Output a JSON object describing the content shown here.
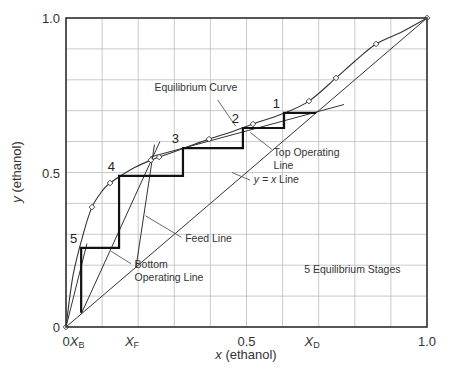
{
  "chart_data": {
    "type": "line",
    "xlabel_var": "x",
    "xlabel_rest": " (ethanol)",
    "ylabel_var": "y",
    "ylabel_rest": " (ethanol)",
    "xlim": [
      0,
      1.0
    ],
    "ylim": [
      0,
      1.0
    ],
    "grid": true,
    "grid_step": 0.1,
    "x_ticks": [
      {
        "value": 0,
        "label": "0"
      },
      {
        "value": 0.5,
        "label": "0.5"
      },
      {
        "value": 1.0,
        "label": "1.0"
      }
    ],
    "y_ticks": [
      {
        "value": 0,
        "label": "0"
      },
      {
        "value": 0.5,
        "label": "0.5"
      },
      {
        "value": 1.0,
        "label": "1.0"
      }
    ],
    "special_x_ticks": [
      {
        "value": 0.042,
        "var": "X",
        "sub": "B"
      },
      {
        "value": 0.194,
        "var": "X",
        "sub": "F"
      },
      {
        "value": 0.693,
        "var": "X",
        "sub": "D"
      }
    ],
    "series": [
      {
        "name": "Equilibrium Curve",
        "style": "curve-with-markers",
        "x": [
          0.0,
          0.02,
          0.05,
          0.072,
          0.1,
          0.122,
          0.18,
          0.235,
          0.258,
          0.33,
          0.396,
          0.46,
          0.518,
          0.6,
          0.673,
          0.748,
          0.8,
          0.859,
          0.93,
          1.0
        ],
        "y": [
          0.0,
          0.17,
          0.31,
          0.388,
          0.44,
          0.466,
          0.51,
          0.54,
          0.55,
          0.58,
          0.608,
          0.632,
          0.657,
          0.69,
          0.731,
          0.806,
          0.86,
          0.916,
          0.955,
          1.0
        ],
        "markers": [
          [
            0.072,
            0.388
          ],
          [
            0.122,
            0.466
          ],
          [
            0.235,
            0.54
          ],
          [
            0.258,
            0.55
          ],
          [
            0.396,
            0.608
          ],
          [
            0.518,
            0.657
          ],
          [
            0.673,
            0.731
          ],
          [
            0.748,
            0.806
          ],
          [
            0.859,
            0.916
          ],
          [
            1.0,
            1.0
          ],
          [
            0.0,
            0.0
          ]
        ]
      },
      {
        "name": "y = x Line",
        "x": [
          0,
          1.0
        ],
        "y": [
          0,
          1.0
        ]
      },
      {
        "name": "Top Operating Line",
        "x": [
          0.233,
          0.77
        ],
        "y": [
          0.55,
          0.72
        ]
      },
      {
        "name": "Bottom Operating Line",
        "x": [
          0.042,
          0.26
        ],
        "y": [
          0.042,
          0.6
        ]
      },
      {
        "name": "Feed Line",
        "x": [
          0.194,
          0.245
        ],
        "y": [
          0.194,
          0.59
        ]
      },
      {
        "name": "Left Construction Line",
        "x": [
          0.0,
          0.058
        ],
        "y": [
          0.0,
          0.27
        ]
      },
      {
        "name": "Stages",
        "style": "staircase-bold",
        "x": [
          0.693,
          0.604,
          0.604,
          0.49,
          0.49,
          0.324,
          0.324,
          0.147,
          0.147,
          0.042,
          0.042
        ],
        "y": [
          0.693,
          0.693,
          0.644,
          0.644,
          0.579,
          0.579,
          0.489,
          0.489,
          0.256,
          0.256,
          0.046
        ]
      }
    ],
    "stage_labels": [
      {
        "label": "1",
        "x": 0.604,
        "y": 0.693
      },
      {
        "label": "2",
        "x": 0.49,
        "y": 0.644
      },
      {
        "label": "3",
        "x": 0.324,
        "y": 0.579
      },
      {
        "label": "4",
        "x": 0.147,
        "y": 0.489
      },
      {
        "label": "5",
        "x": 0.042,
        "y": 0.256
      }
    ],
    "annotations": [
      {
        "text": "Equilibrium Curve",
        "text2": "",
        "tx": 0.245,
        "ty": 0.765,
        "ax": 0.42,
        "ay": 0.735,
        "bx": 0.47,
        "by": 0.65
      },
      {
        "text": "Top Operating",
        "text2": "Line",
        "tx": 0.575,
        "ty": 0.555,
        "ax": 0.57,
        "ay": 0.575,
        "bx": 0.51,
        "by": 0.63
      },
      {
        "text": "y = x Line",
        "italic_prefix": "y = x",
        "rest": " Line",
        "tx": 0.52,
        "ty": 0.465,
        "ax": 0.51,
        "ay": 0.475,
        "bx": 0.46,
        "by": 0.5
      },
      {
        "text": "Feed Line",
        "text2": "",
        "tx": 0.33,
        "ty": 0.275,
        "ax": 0.32,
        "ay": 0.29,
        "bx": 0.22,
        "by": 0.36
      },
      {
        "text": "Bottom",
        "text2": "Operating Line",
        "tx": 0.19,
        "ty": 0.19,
        "ax": 0.18,
        "ay": 0.205,
        "bx": 0.125,
        "by": 0.245
      },
      {
        "text": "5 Equilibrium Stages",
        "text2": "",
        "tx": 0.66,
        "ty": 0.175
      }
    ]
  },
  "colors": {
    "grid": "#bdbdbd",
    "frame": "#333333",
    "curve": "#333333",
    "stage": "#111111",
    "text": "#333333"
  }
}
